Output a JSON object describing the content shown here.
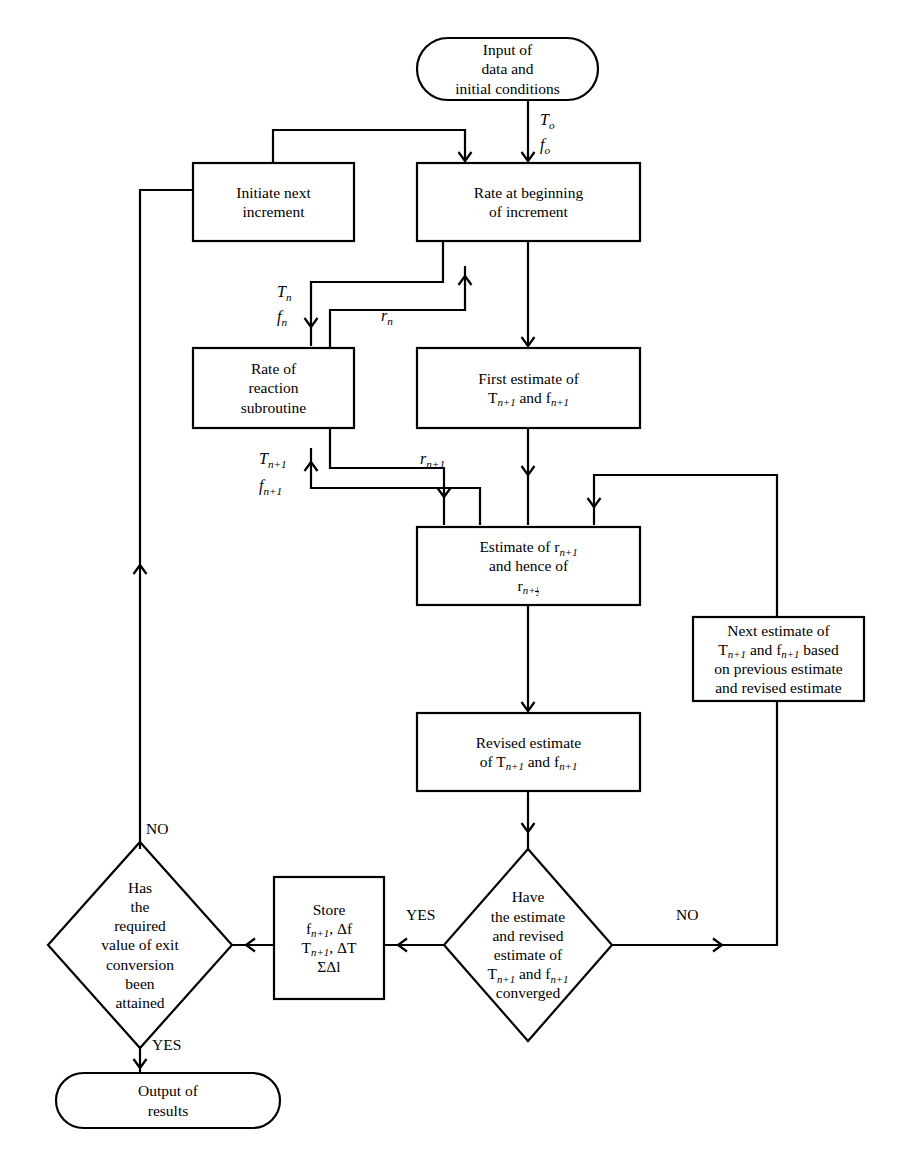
{
  "diagram": {
    "type": "flowchart",
    "canvas": {
      "width": 914,
      "height": 1167,
      "background": "#ffffff",
      "line_color": "#000000"
    },
    "nodes": [
      {
        "id": "input",
        "name": "input-terminal",
        "shape": "terminator",
        "lines": [
          "Input of",
          "data and",
          "initial conditions"
        ],
        "x": 417,
        "y": 38,
        "w": 181,
        "h": 62
      },
      {
        "id": "initiate",
        "name": "initiate-next-increment-process",
        "shape": "rectangle",
        "lines": [
          "Initiate next",
          "increment"
        ],
        "x": 193,
        "y": 163,
        "w": 161,
        "h": 78
      },
      {
        "id": "rate_begin",
        "name": "rate-at-beginning-process",
        "shape": "rectangle",
        "lines": [
          "Rate at beginning",
          "of increment"
        ],
        "x": 417,
        "y": 163,
        "w": 223,
        "h": 78
      },
      {
        "id": "rate_sub",
        "name": "rate-of-reaction-subroutine-process",
        "shape": "rectangle",
        "lines": [
          "Rate of",
          "reaction",
          "subroutine"
        ],
        "x": 193,
        "y": 348,
        "w": 161,
        "h": 80
      },
      {
        "id": "first_est",
        "name": "first-estimate-process",
        "shape": "rectangle",
        "lines": [
          "First estimate of",
          "T<sub>n+1</sub> and f<sub>n+1</sub>"
        ],
        "x": 417,
        "y": 348,
        "w": 223,
        "h": 80
      },
      {
        "id": "estimate_r",
        "name": "estimate-of-r-process",
        "shape": "rectangle",
        "lines": [
          "Estimate of r<sub>n+1</sub>",
          "and hence of",
          "r<sub>n+&frac12;</sub>"
        ],
        "x": 417,
        "y": 527,
        "w": 223,
        "h": 78
      },
      {
        "id": "next_est",
        "name": "next-estimate-process",
        "shape": "rectangle",
        "lines": [
          "Next estimate of",
          "T<sub>n+1</sub> and f<sub>n+1</sub> based",
          "on previous estimate",
          "and revised estimate"
        ],
        "x": 693,
        "y": 617,
        "w": 171,
        "h": 84
      },
      {
        "id": "revised_est",
        "name": "revised-estimate-process",
        "shape": "rectangle",
        "lines": [
          "Revised estimate",
          "of T<sub>n+1</sub> and f<sub>n+1</sub>"
        ],
        "x": 417,
        "y": 713,
        "w": 223,
        "h": 78
      },
      {
        "id": "converged",
        "name": "converged-decision",
        "shape": "diamond",
        "lines": [
          "Have",
          "the estimate",
          "and revised",
          "estimate of",
          "T<sub>n+1</sub> and f<sub>n+1</sub>",
          "converged"
        ],
        "cx": 528,
        "cy": 945,
        "rx": 84,
        "ry": 96
      },
      {
        "id": "store",
        "name": "store-process",
        "shape": "rectangle",
        "lines": [
          "Store",
          "f<sub>n+1</sub>, &Delta;f",
          "T<sub>n+1</sub>, &Delta;T",
          "&Sigma;&Delta;l"
        ],
        "x": 274,
        "y": 877,
        "w": 110,
        "h": 122
      },
      {
        "id": "attained",
        "name": "exit-conversion-decision",
        "shape": "diamond",
        "lines": [
          "Has",
          "the",
          "required",
          "value of exit",
          "conversion",
          "been",
          "attained"
        ],
        "cx": 140,
        "cy": 945,
        "rx": 92,
        "ry": 103
      },
      {
        "id": "output",
        "name": "output-terminal",
        "shape": "terminator",
        "lines": [
          "Output of",
          "results"
        ],
        "x": 56,
        "y": 1073,
        "w": 224,
        "h": 55
      }
    ],
    "edge_labels": [
      {
        "name": "edge-label-T0",
        "text": "T<sub>o</sub>",
        "x": 540,
        "y": 111
      },
      {
        "name": "edge-label-f0",
        "text": "f<sub>o</sub>",
        "x": 540,
        "y": 136
      },
      {
        "name": "edge-label-Tn",
        "text": "T<sub>n</sub>",
        "x": 277,
        "y": 283
      },
      {
        "name": "edge-label-fn",
        "text": "f<sub>n</sub>",
        "x": 277,
        "y": 308
      },
      {
        "name": "edge-label-rn",
        "text": "r<sub>n</sub>",
        "x": 381,
        "y": 307
      },
      {
        "name": "edge-label-Tn1",
        "text": "T<sub>n+1</sub>",
        "x": 259,
        "y": 450
      },
      {
        "name": "edge-label-fn1",
        "text": "f<sub>n+1</sub>",
        "x": 259,
        "y": 477
      },
      {
        "name": "edge-label-rn1",
        "text": "r<sub>n+1</sub>",
        "x": 420,
        "y": 450
      },
      {
        "name": "edge-label-yes-converged",
        "text": "YES",
        "x": 406,
        "y": 906
      },
      {
        "name": "edge-label-no-converged",
        "text": "NO",
        "x": 676,
        "y": 906
      },
      {
        "name": "edge-label-no-attained",
        "text": "NO",
        "x": 146,
        "y": 820
      },
      {
        "name": "edge-label-yes-attained",
        "text": "YES",
        "x": 152,
        "y": 1036
      }
    ],
    "connectors": [
      {
        "name": "edge-input-to-rate-begin",
        "path": "M 528 100 L 528 161",
        "arrow": {
          "x": 528,
          "y": 161,
          "dir": "down"
        }
      },
      {
        "name": "edge-feedback-initiate-to-rate-begin",
        "path": "M 273 163 L 273 130 L 465 130 L 465 161",
        "arrow": {
          "x": 465,
          "y": 161,
          "dir": "down"
        }
      },
      {
        "name": "edge-return-to-initiate",
        "path": "M 140 849 L 140 190 L 193 190",
        "arrow": {
          "x": 140,
          "y": 565,
          "dir": "up"
        }
      },
      {
        "name": "edge-rate-begin-to-first-est",
        "path": "M 528 241 L 528 346",
        "arrow": {
          "x": 528,
          "y": 346,
          "dir": "down"
        }
      },
      {
        "name": "edge-rate-begin-to-subroutine",
        "path": "M 443 241 L 443 282 L 311 282 L 311 346",
        "arrow": {
          "x": 311,
          "y": 327,
          "dir": "down"
        }
      },
      {
        "name": "edge-subroutine-rn-to-rate-begin",
        "path": "M 330 348 L 330 310 L 465 310 L 465 266",
        "arrow": {
          "x": 465,
          "y": 276,
          "dir": "up"
        }
      },
      {
        "name": "edge-first-est-to-estimate-r",
        "path": "M 528 428 L 528 525",
        "arrow": {
          "x": 528,
          "y": 475,
          "dir": "down"
        }
      },
      {
        "name": "edge-subroutine-out-to-estimate-r",
        "path": "M 330 428 L 330 468 L 444 468 L 444 525",
        "arrow": {
          "x": 444,
          "y": 497,
          "dir": "down"
        }
      },
      {
        "name": "edge-estimate-feedback-to-subroutine",
        "path": "M 480 525 L 480 488 L 311 488 L 311 448",
        "arrow": {
          "x": 311,
          "y": 462,
          "dir": "up"
        }
      },
      {
        "name": "edge-next-est-to-estimate-r",
        "path": "M 777 617 L 777 475 L 594 475 L 594 525",
        "arrow": {
          "x": 594,
          "y": 507,
          "dir": "down"
        }
      },
      {
        "name": "edge-estimate-r-to-revised",
        "path": "M 528 605 L 528 711",
        "arrow": {
          "x": 528,
          "y": 711,
          "dir": "down"
        }
      },
      {
        "name": "edge-revised-to-converged",
        "path": "M 528 791 L 528 849",
        "arrow": {
          "x": 528,
          "y": 832,
          "dir": "down"
        }
      },
      {
        "name": "edge-converged-no-to-next-est",
        "path": "M 612 945 L 777 945 L 777 701",
        "arrow": {
          "x": 722,
          "y": 945,
          "dir": "right"
        }
      },
      {
        "name": "edge-converged-yes-to-store",
        "path": "M 444 945 L 384 945",
        "arrow": {
          "x": 398,
          "y": 945,
          "dir": "left"
        }
      },
      {
        "name": "edge-store-to-attained",
        "path": "M 274 945 L 232 945",
        "arrow": {
          "x": 246,
          "y": 945,
          "dir": "left"
        }
      },
      {
        "name": "edge-attained-yes-to-output",
        "path": "M 140 1048 L 140 1073",
        "arrow": {
          "x": 140,
          "y": 1068,
          "dir": "down"
        }
      }
    ]
  }
}
